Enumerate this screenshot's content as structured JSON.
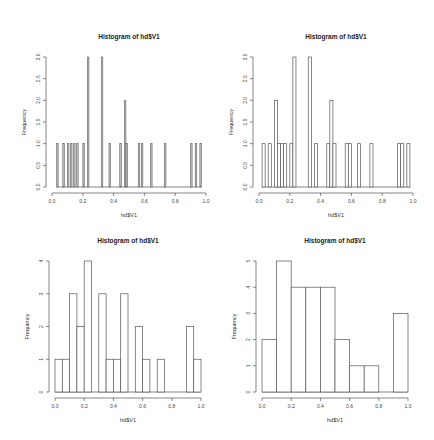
{
  "chart_data": [
    {
      "type": "bar",
      "subtype": "histogram",
      "title": "Histogram of hd$V1",
      "xlabel": "hd$V1",
      "ylabel": "Frequency",
      "bin_width": 0.01,
      "xlim": [
        0,
        1
      ],
      "ylim": [
        0,
        3
      ],
      "x_ticks": [
        "0.0",
        "0.2",
        "0.4",
        "0.6",
        "0.8",
        "1.0"
      ],
      "y_ticks": [
        "0.0",
        "0.5",
        "1.0",
        "1.5",
        "2.0",
        "2.5",
        "3.0"
      ],
      "bins": [
        {
          "start": 0.03,
          "count": 1
        },
        {
          "start": 0.07,
          "count": 1
        },
        {
          "start": 0.1,
          "count": 1
        },
        {
          "start": 0.12,
          "count": 1
        },
        {
          "start": 0.14,
          "count": 1
        },
        {
          "start": 0.16,
          "count": 1
        },
        {
          "start": 0.2,
          "count": 1
        },
        {
          "start": 0.23,
          "count": 3
        },
        {
          "start": 0.32,
          "count": 3
        },
        {
          "start": 0.37,
          "count": 1
        },
        {
          "start": 0.44,
          "count": 1
        },
        {
          "start": 0.47,
          "count": 2
        },
        {
          "start": 0.48,
          "count": 1
        },
        {
          "start": 0.56,
          "count": 1
        },
        {
          "start": 0.58,
          "count": 1
        },
        {
          "start": 0.64,
          "count": 1
        },
        {
          "start": 0.73,
          "count": 1
        },
        {
          "start": 0.9,
          "count": 1
        },
        {
          "start": 0.93,
          "count": 1
        },
        {
          "start": 0.96,
          "count": 1
        }
      ]
    },
    {
      "type": "bar",
      "subtype": "histogram",
      "title": "Histogram of hd$V1",
      "xlabel": "hd$V1",
      "ylabel": "Frequency",
      "bin_width": 0.02,
      "xlim": [
        0,
        1
      ],
      "ylim": [
        0,
        3
      ],
      "x_ticks": [
        "0.0",
        "0.2",
        "0.4",
        "0.6",
        "0.8",
        "1.0"
      ],
      "y_ticks": [
        "0.0",
        "0.5",
        "1.0",
        "1.5",
        "2.0",
        "2.5",
        "3.0"
      ],
      "bins": [
        {
          "start": 0.02,
          "count": 1
        },
        {
          "start": 0.06,
          "count": 1
        },
        {
          "start": 0.1,
          "count": 2
        },
        {
          "start": 0.12,
          "count": 1
        },
        {
          "start": 0.14,
          "count": 1
        },
        {
          "start": 0.16,
          "count": 1
        },
        {
          "start": 0.2,
          "count": 1
        },
        {
          "start": 0.22,
          "count": 3
        },
        {
          "start": 0.32,
          "count": 3
        },
        {
          "start": 0.36,
          "count": 1
        },
        {
          "start": 0.44,
          "count": 1
        },
        {
          "start": 0.46,
          "count": 2
        },
        {
          "start": 0.48,
          "count": 1
        },
        {
          "start": 0.56,
          "count": 1
        },
        {
          "start": 0.58,
          "count": 1
        },
        {
          "start": 0.64,
          "count": 1
        },
        {
          "start": 0.72,
          "count": 1
        },
        {
          "start": 0.9,
          "count": 1
        },
        {
          "start": 0.92,
          "count": 1
        },
        {
          "start": 0.96,
          "count": 1
        }
      ]
    },
    {
      "type": "bar",
      "subtype": "histogram",
      "title": "Histogram of hd$V1",
      "xlabel": "hd$V1",
      "ylabel": "Frequency",
      "bin_width": 0.05,
      "xlim": [
        0,
        1
      ],
      "ylim": [
        0,
        4
      ],
      "x_ticks": [
        "0.0",
        "0.2",
        "0.4",
        "0.6",
        "0.8",
        "1.0"
      ],
      "y_ticks": [
        "0",
        "1",
        "2",
        "3",
        "4"
      ],
      "categories": [
        "0.00-0.05",
        "0.05-0.10",
        "0.10-0.15",
        "0.15-0.20",
        "0.20-0.25",
        "0.25-0.30",
        "0.30-0.35",
        "0.35-0.40",
        "0.40-0.45",
        "0.45-0.50",
        "0.50-0.55",
        "0.55-0.60",
        "0.60-0.65",
        "0.65-0.70",
        "0.70-0.75",
        "0.75-0.80",
        "0.80-0.85",
        "0.85-0.90",
        "0.90-0.95",
        "0.95-1.00"
      ],
      "values": [
        1,
        1,
        3,
        2,
        4,
        0,
        3,
        1,
        1,
        3,
        0,
        2,
        1,
        0,
        1,
        0,
        0,
        0,
        2,
        1
      ]
    },
    {
      "type": "bar",
      "subtype": "histogram",
      "title": "Histogram of hd$V1",
      "xlabel": "hd$V1",
      "ylabel": "Frequency",
      "bin_width": 0.1,
      "xlim": [
        0,
        1
      ],
      "ylim": [
        0,
        5
      ],
      "x_ticks": [
        "0.0",
        "0.2",
        "0.4",
        "0.6",
        "0.8",
        "1.0"
      ],
      "y_ticks": [
        "0",
        "1",
        "2",
        "3",
        "4",
        "5"
      ],
      "categories": [
        "0.0-0.1",
        "0.1-0.2",
        "0.2-0.3",
        "0.3-0.4",
        "0.4-0.5",
        "0.5-0.6",
        "0.6-0.7",
        "0.7-0.8",
        "0.8-0.9",
        "0.9-1.0"
      ],
      "values": [
        2,
        5,
        4,
        4,
        4,
        2,
        1,
        1,
        0,
        3
      ]
    }
  ],
  "layout": {
    "panels": [
      {
        "x0": 52,
        "x1": 206,
        "yBase": 187,
        "yTop": 57,
        "ymax": 3,
        "dense": true
      },
      {
        "x0": 259,
        "x1": 413,
        "yBase": 187,
        "yTop": 57,
        "ymax": 3,
        "dense": false
      },
      {
        "x0": 55,
        "x1": 201,
        "yBase": 392,
        "yTop": 261,
        "ymax": 4,
        "dense": false
      },
      {
        "x0": 262,
        "x1": 408,
        "yBase": 392,
        "yTop": 261,
        "ymax": 5,
        "dense": false
      }
    ]
  }
}
